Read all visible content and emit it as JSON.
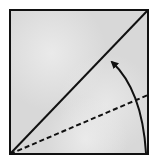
{
  "diagram": {
    "type": "origami-fold-step",
    "canvas": {
      "width": 156,
      "height": 167,
      "background": "#ffffff"
    },
    "paper": {
      "shape": "square",
      "x": 10,
      "y": 10,
      "width": 138,
      "height": 144,
      "fill": "#d8d8d8",
      "fill_highlight": "#e9e9e9",
      "stroke": "#111111",
      "stroke_width": 2
    },
    "diagonal": {
      "style": "solid",
      "from": [
        10,
        154
      ],
      "to": [
        148,
        10
      ],
      "stroke": "#111111",
      "stroke_width": 2
    },
    "fold_line": {
      "style": "dashed",
      "dash": "5 3",
      "from": [
        10,
        154
      ],
      "to": [
        148,
        95
      ],
      "stroke": "#111111",
      "stroke_width": 2
    },
    "arrow": {
      "style": "curved",
      "start": [
        146,
        153
      ],
      "control": [
        142,
        90
      ],
      "end": [
        112,
        62
      ],
      "stroke": "#111111",
      "stroke_width": 2,
      "head": "filled-triangle",
      "meaning": "fold bottom edge up to diagonal"
    }
  }
}
